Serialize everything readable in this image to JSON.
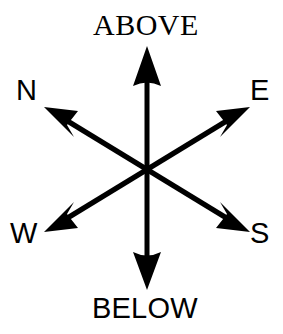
{
  "diagram": {
    "type": "orientation-compass",
    "background_color": "#ffffff",
    "stroke_color": "#000000",
    "center": {
      "x": 147,
      "y": 170
    },
    "labels": {
      "above": "ABOVE",
      "below": "BELOW",
      "north": "N",
      "east": "E",
      "west": "W",
      "south": "S"
    },
    "axes": [
      {
        "name": "vertical-axis",
        "from_label": "BELOW",
        "to_label": "ABOVE",
        "orientation": "vertical",
        "double_headed": true,
        "tip_top": {
          "x": 147,
          "y": 46
        },
        "tip_bottom": {
          "x": 147,
          "y": 290
        }
      },
      {
        "name": "north-south-axis",
        "from_label": "S",
        "to_label": "N",
        "orientation": "diagonal-nw-se",
        "double_headed": true,
        "tip_nw": {
          "x": 44,
          "y": 107
        },
        "tip_se": {
          "x": 250,
          "y": 232
        }
      },
      {
        "name": "east-west-axis",
        "from_label": "W",
        "to_label": "E",
        "orientation": "diagonal-ne-sw",
        "double_headed": true,
        "tip_ne": {
          "x": 250,
          "y": 107
        },
        "tip_sw": {
          "x": 44,
          "y": 232
        }
      }
    ]
  }
}
